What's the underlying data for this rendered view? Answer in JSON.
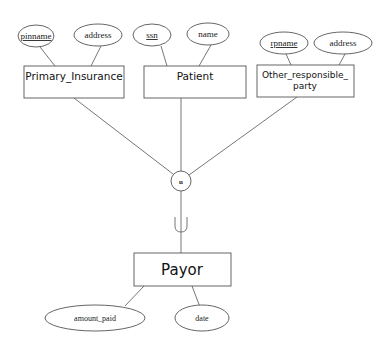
{
  "diagram": {
    "type": "ER diagram",
    "colors": {
      "stroke": "#555555",
      "text": "#111111",
      "background": "#ffffff"
    },
    "entities": [
      {
        "id": "primary_insurance",
        "label": "Primary_Insurance"
      },
      {
        "id": "patient",
        "label": "Patient"
      },
      {
        "id": "other_responsible_party",
        "label_line1": "Other_responsible_",
        "label_line2": "party"
      },
      {
        "id": "payor",
        "label": "Payor"
      }
    ],
    "attributes": {
      "primary_insurance": [
        {
          "label": "pinname",
          "key": true
        },
        {
          "label": "address",
          "key": false
        }
      ],
      "patient": [
        {
          "label": "ssn",
          "key": true
        },
        {
          "label": "name",
          "key": false
        }
      ],
      "other_responsible_party": [
        {
          "label": "rpname",
          "key": true
        },
        {
          "label": "address",
          "key": false
        }
      ],
      "payor": [
        {
          "label": "amount_paid",
          "key": false
        },
        {
          "label": "date",
          "key": false
        }
      ]
    },
    "union_node": {
      "label": "u"
    },
    "subset_symbol": "union-cup"
  }
}
